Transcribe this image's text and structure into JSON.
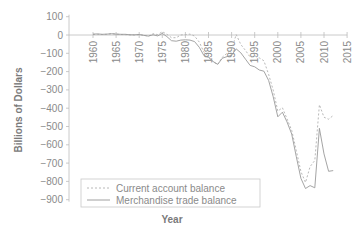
{
  "chart_data": {
    "type": "line",
    "title": "",
    "xlabel": "Year",
    "ylabel": "Billions of Dollars",
    "xlim": [
      1960,
      2015
    ],
    "ylim": [
      -900,
      100
    ],
    "x_ticks": [
      "1960",
      "1965",
      "1970",
      "1975",
      "1980",
      "1985",
      "1990",
      "1995",
      "2000",
      "2005",
      "2010",
      "2015"
    ],
    "y_ticks": [
      "100",
      "0",
      "-100",
      "-200",
      "-300",
      "-400",
      "-500",
      "-600",
      "-700",
      "-800",
      "-900"
    ],
    "grid": false,
    "legend_position": "lower left",
    "x": [
      1960,
      1961,
      1962,
      1963,
      1964,
      1965,
      1966,
      1967,
      1968,
      1969,
      1970,
      1971,
      1972,
      1973,
      1974,
      1975,
      1976,
      1977,
      1978,
      1979,
      1980,
      1981,
      1982,
      1983,
      1984,
      1985,
      1986,
      1987,
      1988,
      1989,
      1990,
      1991,
      1992,
      1993,
      1994,
      1995,
      1996,
      1997,
      1998,
      1999,
      2000,
      2001,
      2002,
      2003,
      2004,
      2005,
      2006,
      2007,
      2008,
      2009,
      2010,
      2011,
      2012
    ],
    "series": [
      {
        "name": "Current account balance",
        "color": "#b0b0b0",
        "dash": "2,2",
        "values": [
          3,
          4,
          3,
          4,
          7,
          5,
          3,
          2,
          1,
          0,
          2,
          -1,
          -6,
          7,
          2,
          18,
          4,
          -15,
          -15,
          0,
          2,
          5,
          -6,
          -39,
          -94,
          -118,
          -147,
          -161,
          -121,
          -100,
          -79,
          3,
          -52,
          -84,
          -121,
          -114,
          -125,
          -141,
          -215,
          -301,
          -416,
          -397,
          -458,
          -521,
          -631,
          -746,
          -806,
          -719,
          -686,
          -381,
          -449,
          -460,
          -440
        ]
      },
      {
        "name": "Merchandise trade balance",
        "color": "#9a9a9a",
        "dash": "",
        "values": [
          5,
          6,
          4,
          5,
          7,
          5,
          4,
          4,
          1,
          1,
          3,
          -2,
          -6,
          1,
          -5,
          9,
          -9,
          -31,
          -34,
          -28,
          -26,
          -28,
          -36,
          -67,
          -112,
          -122,
          -145,
          -160,
          -127,
          -118,
          -111,
          -76,
          -97,
          -132,
          -166,
          -174,
          -191,
          -198,
          -248,
          -337,
          -447,
          -422,
          -475,
          -541,
          -665,
          -783,
          -839,
          -823,
          -835,
          -510,
          -650,
          -745,
          -741
        ]
      }
    ]
  },
  "legend": {
    "items": [
      {
        "label": "Current account balance"
      },
      {
        "label": "Merchandise trade balance"
      }
    ]
  },
  "axes": {
    "xlabel": "Year",
    "ylabel": "Billions of Dollars"
  }
}
